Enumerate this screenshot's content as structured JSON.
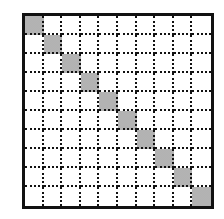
{
  "diagram": {
    "type": "grid",
    "rows": 10,
    "columns": 10,
    "line_style": "dotted",
    "border_color": "#111111",
    "shaded_color": "#c8c8c8",
    "shaded_cells": [
      [
        0,
        0
      ],
      [
        1,
        1
      ],
      [
        2,
        2
      ],
      [
        3,
        3
      ],
      [
        4,
        4
      ],
      [
        5,
        5
      ],
      [
        6,
        6
      ],
      [
        7,
        7
      ],
      [
        8,
        8
      ],
      [
        9,
        9
      ]
    ]
  }
}
